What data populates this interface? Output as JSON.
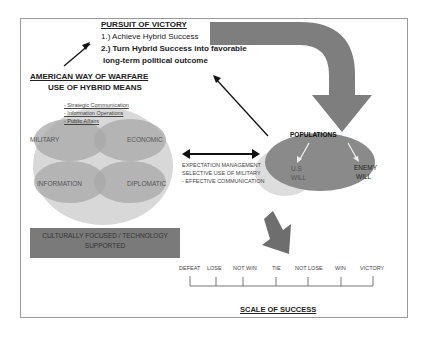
{
  "pursuit": {
    "title": "PURSUIT OF VICTORY",
    "line1": "1.) Achieve  Hybrid Success",
    "line2": "2.) Turn Hybrid Success into favorable",
    "line3": "long-term political outcome"
  },
  "american_way": {
    "title": "AMERICAN WAY OF WARFARE",
    "subtitle": "USE OF HYBRID MEANS",
    "bullets": [
      "- Strategic Communication",
      "- Information Operations",
      "- Public Affairs"
    ],
    "quadrants": [
      "MILITARY",
      "ECONOMIC",
      "INFORMATION",
      "DIPLOMATIC"
    ]
  },
  "middle_text": [
    "EXPECTATION MANAGEMENT",
    "SELECTIVE USE OF MILITARY",
    "- EFFECTIVE COMMUNICATION"
  ],
  "footer_box": {
    "line1": "CULTURALLY FOCUSED / TECHNOLOGY",
    "line2": "SUPPORTED"
  },
  "populations": {
    "title": "POPULATIONS",
    "us_will": [
      "U.S",
      "WILL"
    ],
    "enemy_will": [
      "ENEMY",
      "WILL"
    ]
  },
  "scale": {
    "labels": [
      "DEFEAT",
      "LOSE",
      "NOT WIN",
      "TIE",
      "NOT LOSE",
      "WIN",
      "VICTORY"
    ],
    "title": "SCALE OF SUCCESS"
  },
  "colors": {
    "dark_gray": "#7a7a7a",
    "mid_gray": "#9c9c9c",
    "light_gray": "#c9c9c9",
    "oval_bg": "#dcdcdc"
  }
}
